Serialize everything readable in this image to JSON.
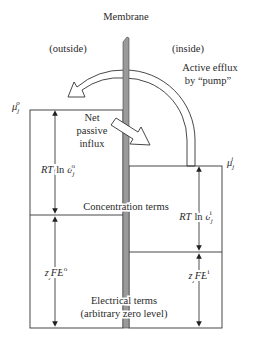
{
  "diagram": {
    "title": "Membrane",
    "regions": {
      "outside_label": "(outside)",
      "inside_label": "(inside)"
    },
    "potentials": {
      "outside_mu": {
        "base": "μ",
        "sub": "j",
        "sup": "o"
      },
      "inside_mu": {
        "base": "μ",
        "sub": "j",
        "sup": "i"
      }
    },
    "fluxes": {
      "active_efflux_line1": "Active efflux",
      "active_efflux_line2": "by “pump”",
      "passive_line1": "Net",
      "passive_line2": "passive",
      "passive_line3": "influx"
    },
    "terms": {
      "outside_concentration": {
        "prefix": "RT",
        "fn": "ln",
        "var": "a",
        "sub": "j",
        "sup": "o"
      },
      "inside_concentration": {
        "prefix": "RT",
        "fn": "ln",
        "var": "a",
        "sub": "j",
        "sup": "i"
      },
      "outside_electrical": {
        "z": "z",
        "sub": "j",
        "rest": "FE",
        "sup": "o"
      },
      "inside_electrical": {
        "z": "z",
        "sub": "j",
        "rest": "FE",
        "sup": "i"
      },
      "concentration_label": "Concentration terms",
      "electrical_label_line1": "Electrical terms",
      "electrical_label_line2": "(arbitrary zero level)"
    },
    "colors": {
      "line": "#333333",
      "membrane_fill": "#9a9a9a",
      "arrow_fill": "#ffffff"
    }
  }
}
